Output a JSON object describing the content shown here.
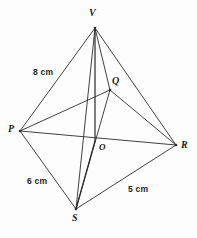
{
  "figure": {
    "kind": "geometry-diagram",
    "background_color": "#fdfdfd",
    "line_color": "#2b2b2b",
    "text_color": "#1b1b1b",
    "width": 197,
    "height": 238
  },
  "vertices": [
    {
      "id": "V",
      "label": "V",
      "x": 95,
      "y": 28,
      "label_x": 89,
      "label_y": 8,
      "role": "apex"
    },
    {
      "id": "Q",
      "label": "Q",
      "x": 110,
      "y": 90,
      "label_x": 112,
      "label_y": 76,
      "role": "base-corner"
    },
    {
      "id": "P",
      "label": "P",
      "x": 20,
      "y": 131,
      "label_x": 8,
      "label_y": 124,
      "role": "base-corner"
    },
    {
      "id": "R",
      "label": "R",
      "x": 176,
      "y": 145,
      "label_x": 181,
      "label_y": 140,
      "role": "base-corner"
    },
    {
      "id": "S",
      "label": "S",
      "x": 76,
      "y": 209,
      "label_x": 72,
      "label_y": 213,
      "role": "base-corner"
    },
    {
      "id": "O",
      "label": "O",
      "x": 95,
      "y": 141,
      "label_x": 99,
      "label_y": 143,
      "role": "centre"
    }
  ],
  "edges": [
    {
      "id": "PV",
      "from": "P",
      "to": "V",
      "style": "solid"
    },
    {
      "id": "VQ",
      "from": "V",
      "to": "Q",
      "style": "solid"
    },
    {
      "id": "VR",
      "from": "V",
      "to": "R",
      "style": "solid"
    },
    {
      "id": "VS",
      "from": "V",
      "to": "S",
      "style": "solid"
    },
    {
      "id": "VO",
      "from": "V",
      "to": "O",
      "style": "solid-thick"
    },
    {
      "id": "OS",
      "from": "O",
      "to": "S",
      "style": "solid-thick"
    },
    {
      "id": "PQ",
      "from": "P",
      "to": "Q",
      "style": "solid"
    },
    {
      "id": "QR",
      "from": "Q",
      "to": "R",
      "style": "solid"
    },
    {
      "id": "RS",
      "from": "R",
      "to": "S",
      "style": "solid"
    },
    {
      "id": "SP",
      "from": "S",
      "to": "P",
      "style": "solid"
    },
    {
      "id": "PR",
      "from": "P",
      "to": "R",
      "style": "solid"
    },
    {
      "id": "QS",
      "from": "Q",
      "to": "S",
      "style": "solid"
    }
  ],
  "measurements": [
    {
      "id": "PV-length",
      "text": "8 cm",
      "edge": "PV",
      "x": 33,
      "y": 68
    },
    {
      "id": "SP-length",
      "text": "6 cm",
      "edge": "SP",
      "x": 27,
      "y": 177
    },
    {
      "id": "RS-length",
      "text": "5 cm",
      "edge": "RS",
      "x": 128,
      "y": 185
    }
  ]
}
